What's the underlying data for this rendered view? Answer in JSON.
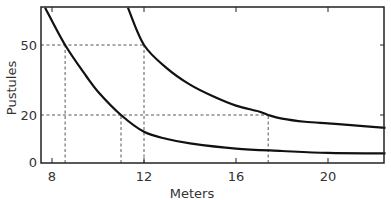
{
  "chart_data": {
    "type": "line",
    "title": "",
    "xlabel": "Meters",
    "ylabel": "Pustules",
    "xlim": [
      7.6,
      22.5
    ],
    "ylim": [
      0,
      66
    ],
    "x_ticks": [
      8,
      12,
      16,
      20
    ],
    "y_ticks": [
      0,
      20,
      50
    ],
    "grid": false,
    "legend": null,
    "series": [
      {
        "name": "upper-curve",
        "points": [
          [
            11.3,
            66
          ],
          [
            12,
            50
          ],
          [
            13,
            40
          ],
          [
            14,
            33
          ],
          [
            15,
            28
          ],
          [
            16,
            24
          ],
          [
            17,
            21.5
          ],
          [
            17.4,
            20
          ],
          [
            18,
            18.5
          ],
          [
            19,
            17.2
          ],
          [
            20,
            16.5
          ],
          [
            21,
            15.8
          ],
          [
            22.5,
            14.6
          ]
        ]
      },
      {
        "name": "lower-curve",
        "points": [
          [
            7.7,
            66
          ],
          [
            8.57,
            50
          ],
          [
            9.5,
            36.5
          ],
          [
            10,
            30
          ],
          [
            11.0,
            20
          ],
          [
            12,
            13
          ],
          [
            13,
            10
          ],
          [
            14,
            8.2
          ],
          [
            16,
            6
          ],
          [
            18,
            5
          ],
          [
            20,
            4.2
          ],
          [
            22.5,
            4
          ]
        ]
      }
    ],
    "reference_lines": [
      {
        "type": "horizontal",
        "y": 50,
        "x_from": 7.6,
        "x_to": 12
      },
      {
        "type": "horizontal",
        "y": 20,
        "x_from": 7.6,
        "x_to": 17.4
      },
      {
        "type": "vertical",
        "x": 8.57,
        "y_from": 0,
        "y_to": 50
      },
      {
        "type": "vertical",
        "x": 11.0,
        "y_from": 0,
        "y_to": 20
      },
      {
        "type": "vertical",
        "x": 12,
        "y_from": 0,
        "y_to": 50
      },
      {
        "type": "vertical",
        "x": 17.4,
        "y_from": 0,
        "y_to": 20
      }
    ],
    "annotations": []
  },
  "labels": {
    "x_axis": "Meters",
    "y_axis": "Pustules",
    "x_ticks": [
      "8",
      "12",
      "16",
      "20"
    ],
    "y_ticks": [
      "0",
      "20",
      "50"
    ]
  },
  "colors": {
    "curve": "#111111",
    "frame": "#222222",
    "dashed": "#444444"
  }
}
